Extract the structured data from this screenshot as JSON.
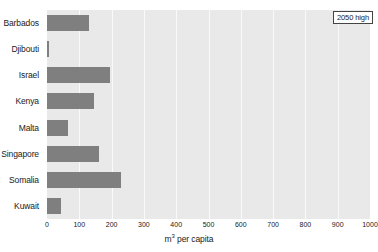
{
  "chart_data": {
    "type": "bar",
    "orientation": "horizontal",
    "title": "",
    "xlabel": "m³ per capita",
    "ylabel": "",
    "xlim": [
      0,
      1000
    ],
    "xticks": [
      0,
      100,
      200,
      300,
      400,
      500,
      600,
      700,
      800,
      900,
      1000
    ],
    "xtick_labels": [
      "0",
      "100",
      "200",
      "300",
      "400",
      "500",
      "600",
      "700",
      "800",
      "900",
      "1000"
    ],
    "grid": true,
    "grid_axis": "x",
    "categories": [
      "Barbados",
      "Djibouti",
      "Israel",
      "Kenya",
      "Malta",
      "Singapore",
      "Somalia",
      "Kuwait"
    ],
    "values": [
      130,
      5,
      195,
      145,
      65,
      160,
      230,
      43
    ],
    "series": [
      {
        "name": "2050 high",
        "values": [
          130,
          5,
          195,
          145,
          65,
          160,
          230,
          43
        ],
        "color": "#7f7f7f"
      }
    ],
    "legend": {
      "position": "top-right",
      "entries": [
        "2050 high"
      ]
    },
    "plot_background_color": "#e9e9e9",
    "gridline_color": "#fafafa",
    "bar_color": "#7f7f7f"
  },
  "axis": {
    "x_title_prefix": "m",
    "x_title_superscript": "3",
    "x_title_suffix": " per capita"
  },
  "legend": {
    "label": "2050 high"
  }
}
